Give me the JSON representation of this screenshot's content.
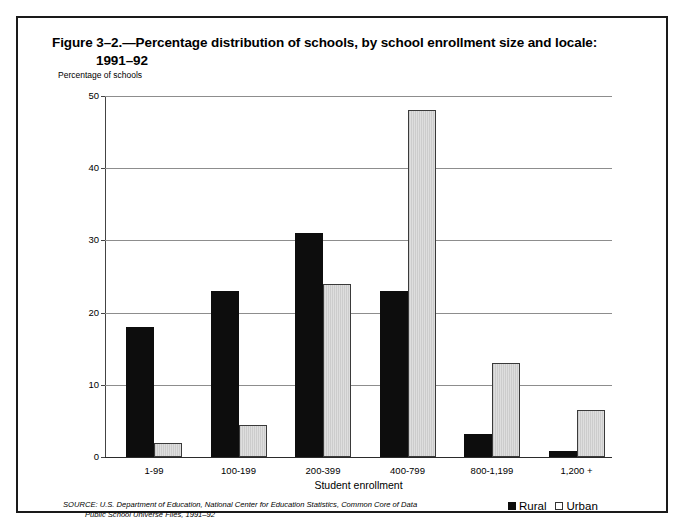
{
  "figure": {
    "title_line1": "Figure 3–2.—Percentage distribution of schools, by school enrollment size and locale:",
    "title_line2": "1991–92",
    "y_axis_caption": "Percentage of schools",
    "x_axis_caption": "Student enrollment",
    "source_line1": "SOURCE: U.S. Department of Education, National Center for Education Statistics, Common Core of Data",
    "source_line2": "Public School Universe Files, 1991–92"
  },
  "legend": {
    "items": [
      {
        "label": "Rural",
        "swatch": "filled-black-square",
        "color": "#0d0d0d"
      },
      {
        "label": "Urban",
        "swatch": "open-square",
        "color": "#ffffff"
      }
    ]
  },
  "chart_data": {
    "type": "bar",
    "title": "Figure 3–2.—Percentage distribution of schools, by school enrollment size and locale: 1991–92",
    "xlabel": "Student enrollment",
    "ylabel": "Percentage of schools",
    "categories": [
      "1-99",
      "100-199",
      "200-399",
      "400-799",
      "800-1,199",
      "1,200 +"
    ],
    "series": [
      {
        "name": "Rural",
        "color": "#0d0d0d",
        "values": [
          18,
          23,
          31,
          23,
          3.2,
          0.8
        ]
      },
      {
        "name": "Urban",
        "color": "#d4d4d4",
        "values": [
          2,
          4.5,
          24,
          48,
          13,
          6.5
        ]
      }
    ],
    "ylim": [
      0,
      50
    ],
    "yticks": [
      0,
      10,
      20,
      30,
      40,
      50
    ],
    "ytick_labels": [
      "0",
      "10",
      "20",
      "30",
      "40",
      "50"
    ],
    "grid": true,
    "grid_axis": "y",
    "legend_position": "bottom-right"
  }
}
